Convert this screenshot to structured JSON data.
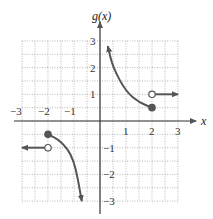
{
  "chart_data": {
    "type": "line",
    "title": "",
    "xlabel": "x",
    "ylabel": "g(x)",
    "xlim": [
      -3,
      3
    ],
    "ylim": [
      -3,
      3
    ],
    "grid": true,
    "grid_step": 0.5,
    "x_ticks": [
      "-3",
      "-2",
      "-1",
      "1",
      "2",
      "3"
    ],
    "y_ticks": [
      "3",
      "2",
      "1",
      "-1",
      "-2",
      "-3"
    ],
    "series": [
      {
        "name": "left horizontal ray",
        "points": [
          [
            -3,
            -1
          ],
          [
            -2,
            -1
          ]
        ],
        "endpoint": {
          "x": -2,
          "y": -1,
          "style": "open"
        },
        "arrow": "left"
      },
      {
        "name": "left curve",
        "points": [
          [
            -2,
            -0.5
          ],
          [
            -1.5,
            -0.75
          ],
          [
            -1,
            -1.4
          ],
          [
            -0.7,
            -3
          ]
        ],
        "endpoint": {
          "x": -2,
          "y": -0.5,
          "style": "filled"
        },
        "arrow": "down"
      },
      {
        "name": "right curve",
        "points": [
          [
            0.3,
            2.8
          ],
          [
            0.5,
            2
          ],
          [
            1,
            1.1
          ],
          [
            1.5,
            0.7
          ],
          [
            2,
            0.5
          ]
        ],
        "endpoint": {
          "x": 2,
          "y": 0.5,
          "style": "filled"
        },
        "arrow": "up"
      },
      {
        "name": "right horizontal ray",
        "points": [
          [
            2,
            1
          ],
          [
            3,
            1
          ]
        ],
        "endpoint": {
          "x": 2,
          "y": 1,
          "style": "open"
        },
        "arrow": "right"
      }
    ]
  }
}
